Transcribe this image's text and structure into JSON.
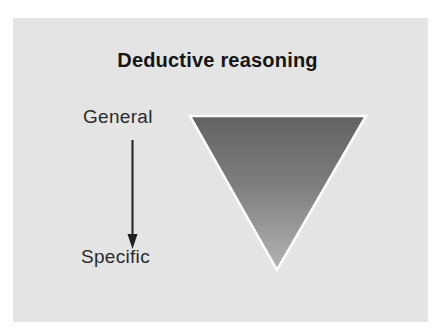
{
  "title": "Deductive reasoning",
  "labels": {
    "top": "General",
    "bottom": "Specific"
  },
  "colors": {
    "panel_background": "#e4e4e4",
    "triangle_top": "#626262",
    "triangle_bottom": "#b0b0b0",
    "triangle_stroke": "#ffffff",
    "arrow": "#1e1e1e",
    "text": "#2a2a2a"
  },
  "shapes": {
    "triangle": {
      "direction": "inverted",
      "meaning": "broad-to-narrow"
    },
    "arrow": {
      "direction": "down",
      "from": "General",
      "to": "Specific"
    }
  }
}
